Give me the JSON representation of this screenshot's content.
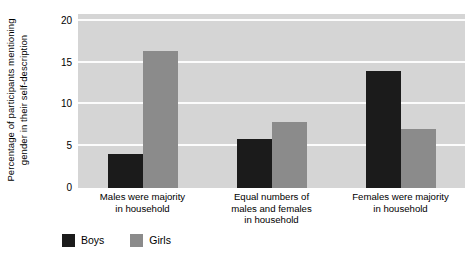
{
  "chart_data": {
    "type": "bar",
    "title": "",
    "xlabel": "",
    "ylabel_lines": [
      "Percentage of participants mentioning",
      "gender in their self-description"
    ],
    "ylabel": "Percentage of participants mentioning gender in their self-description",
    "ylim": [
      0,
      20.8
    ],
    "yticks": [
      0,
      5,
      10,
      15,
      20
    ],
    "ytick_labels": [
      "0",
      "5",
      "10",
      "15",
      "20"
    ],
    "grid": true,
    "grid_axis": "y",
    "legend_position": "below-left",
    "categories": [
      [
        "Males were majority",
        "in household"
      ],
      [
        "Equal numbers of",
        "males and females",
        "in household"
      ],
      [
        "Females were majority",
        "in household"
      ]
    ],
    "category_labels": [
      "Males were majority in household",
      "Equal numbers of males and females in household",
      "Females were majority in household"
    ],
    "series": [
      {
        "name": "Boys",
        "color": "#1b1b1b",
        "values": [
          4.1,
          5.8,
          14.0
        ]
      },
      {
        "name": "Girls",
        "color": "#8b8b8b",
        "values": [
          16.4,
          7.9,
          7.1
        ]
      }
    ],
    "plot_background": "#d5d5d5",
    "gridline_color": "#fcfcfc",
    "page_background": "#ffffff"
  },
  "legend": {
    "items": [
      {
        "label": "Boys"
      },
      {
        "label": "Girls"
      }
    ]
  }
}
